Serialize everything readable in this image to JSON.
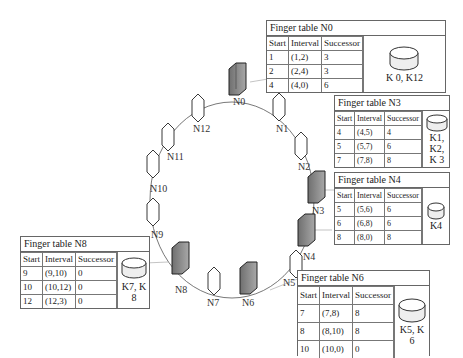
{
  "nodes": [
    {
      "id": "N0",
      "label": "N0",
      "type": "server",
      "active": true
    },
    {
      "id": "N1",
      "label": "N1",
      "type": "virtual",
      "active": false
    },
    {
      "id": "N2",
      "label": "N2",
      "type": "virtual",
      "active": false
    },
    {
      "id": "N3",
      "label": "N3",
      "type": "server",
      "active": true
    },
    {
      "id": "N4",
      "label": "N4",
      "type": "server",
      "active": true
    },
    {
      "id": "N5",
      "label": "N5",
      "type": "virtual",
      "active": false
    },
    {
      "id": "N6",
      "label": "N6",
      "type": "server",
      "active": true
    },
    {
      "id": "N7",
      "label": "N7",
      "type": "virtual",
      "active": false
    },
    {
      "id": "N8",
      "label": "N8",
      "type": "server",
      "active": true
    },
    {
      "id": "N9",
      "label": "N9",
      "type": "virtual",
      "active": false
    },
    {
      "id": "N10",
      "label": "N10",
      "type": "virtual",
      "active": false
    },
    {
      "id": "N11",
      "label": "N11",
      "type": "virtual",
      "active": false
    },
    {
      "id": "N12",
      "label": "N12",
      "type": "virtual",
      "active": false
    }
  ],
  "finger_tables": {
    "n0": {
      "title": "Finger table N0",
      "headers": [
        "Start",
        "Interval",
        "Successor"
      ],
      "rows": [
        [
          "1",
          "(1,2)",
          "3"
        ],
        [
          "2",
          "(2,4)",
          "3"
        ],
        [
          "4",
          "(4,0)",
          "6"
        ]
      ],
      "keys": "K 0, K12"
    },
    "n3": {
      "title": "Finger table N3",
      "headers": [
        "Start",
        "Interval",
        "Successor"
      ],
      "rows": [
        [
          "4",
          "(4,5)",
          "4"
        ],
        [
          "5",
          "(5,7)",
          "6"
        ],
        [
          "7",
          "(7,8)",
          "8"
        ]
      ],
      "keys": "K1, K2, K 3"
    },
    "n4": {
      "title": "Finger table N4",
      "headers": [
        "Start",
        "Interval",
        "Successor"
      ],
      "rows": [
        [
          "5",
          "(5,6)",
          "6"
        ],
        [
          "6",
          "(6,8)",
          "6"
        ],
        [
          "8",
          "(8,0)",
          "8"
        ]
      ],
      "keys": "K4"
    },
    "n6": {
      "title": "Finger table N6",
      "headers": [
        "Start",
        "Interval",
        "Successor"
      ],
      "rows": [
        [
          "7",
          "(7,8)",
          "8"
        ],
        [
          "8",
          "(8,10)",
          "8"
        ],
        [
          "10",
          "(10,0)",
          "0"
        ]
      ],
      "keys": "K5, K 6"
    },
    "n8": {
      "title": "Finger table N8",
      "headers": [
        "Start",
        "Interval",
        "Successor"
      ],
      "rows": [
        [
          "9",
          "(9,10)",
          "0"
        ],
        [
          "10",
          "(10,12)",
          "0"
        ],
        [
          "12",
          "(12,3)",
          "0"
        ]
      ],
      "keys": "K7, K 8"
    }
  },
  "colors": {
    "server_fill": "#8c8c8c",
    "virtual_fill": "#ffffff",
    "line": "#555555"
  }
}
